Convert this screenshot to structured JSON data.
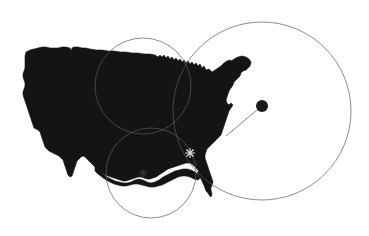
{
  "figure": {
    "type": "map",
    "title": "",
    "background_color": "#ffffff",
    "land_color": "#141414",
    "circle_stroke_color": "#5b5b5b",
    "connector_color": "#6a6a6a",
    "marker_color": "#e8e8e8",
    "width": 369,
    "height": 236
  },
  "map": {
    "region_name": "Contiguous United States",
    "silhouette_fill": "#141414",
    "bounds": {
      "x": 22,
      "y": 46,
      "width": 232,
      "height": 150
    }
  },
  "range_circles": [
    {
      "id": "circle-northern",
      "label": "",
      "center_x": 143,
      "center_y": 86,
      "radius": 48,
      "stroke": "#5b5b5b"
    },
    {
      "id": "circle-southern",
      "label": "",
      "center_x": 151,
      "center_y": 173,
      "radius": 45,
      "stroke": "#5b5b5b"
    },
    {
      "id": "circle-atlantic",
      "label": "",
      "center_x": 262,
      "center_y": 111,
      "radius": 89,
      "stroke": "#5b5b5b"
    }
  ],
  "point_markers": [
    {
      "id": "offshore-node",
      "label": "",
      "x": 262,
      "y": 106,
      "radius": 6,
      "fill": "#1a1a1a"
    },
    {
      "id": "southeast-star-marker",
      "label": "",
      "x": 190,
      "y": 153,
      "style": "star",
      "stroke": "#e8e8e8"
    },
    {
      "id": "gulf-faint-marker",
      "label": "",
      "x": 143,
      "y": 173,
      "style": "star",
      "stroke": "#3a3a3a"
    }
  ],
  "connectors": [
    {
      "id": "offshore-to-coast",
      "label": "",
      "from_x": 257,
      "from_y": 110,
      "to_x": 226,
      "to_y": 136,
      "stroke": "#6a6a6a"
    }
  ],
  "labels": {
    "visible_text": []
  }
}
